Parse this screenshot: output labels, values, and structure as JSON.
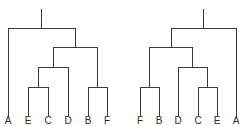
{
  "diagram": {
    "type": "dendrogram-pair",
    "trees": [
      {
        "id": "tree-left",
        "newick": "(A,(((E,C),D),(B,F)))",
        "leaves": [
          "A",
          "E",
          "C",
          "D",
          "B",
          "F"
        ],
        "clades": [
          [
            "E",
            "C"
          ],
          [
            "E",
            "C",
            "D"
          ],
          [
            "B",
            "F"
          ],
          [
            "E",
            "C",
            "D",
            "B",
            "F"
          ],
          [
            "A",
            "E",
            "C",
            "D",
            "B",
            "F"
          ]
        ]
      },
      {
        "id": "tree-right",
        "newick": "(((F,B),(D,(C,E))),A)",
        "leaves": [
          "F",
          "B",
          "D",
          "C",
          "E",
          "A"
        ],
        "clades": [
          [
            "F",
            "B"
          ],
          [
            "C",
            "E"
          ],
          [
            "D",
            "C",
            "E"
          ],
          [
            "F",
            "B",
            "D",
            "C",
            "E"
          ],
          [
            "F",
            "B",
            "D",
            "C",
            "E",
            "A"
          ]
        ]
      }
    ]
  }
}
